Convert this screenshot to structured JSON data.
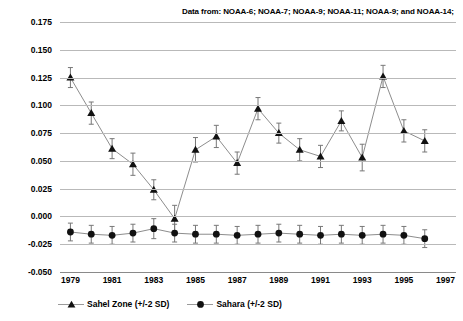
{
  "caption": {
    "data_source": "Data from: NOAA-6; NOAA-7; NOAA-9; NOAA-11; NOAA-9; and NOAA-14;"
  },
  "axes": {
    "y_title": "NDVI",
    "x_title": "",
    "y_ticks": [
      "0.175",
      "0.150",
      "0.125",
      "0.100",
      "0.075",
      "0.050",
      "0.025",
      "0.000",
      "-0.025",
      "-0.050"
    ],
    "x_ticks": [
      "1979",
      "1981",
      "1983",
      "1985",
      "1987",
      "1989",
      "1991",
      "1993",
      "1995",
      "1997"
    ]
  },
  "legend": {
    "items": [
      {
        "label": "Sahel Zone (+/-2 SD)",
        "marker": "triangle-marker-icon",
        "color": "#111111"
      },
      {
        "label": "Sahara (+/-2 SD)",
        "marker": "circle-marker-icon",
        "color": "#111111"
      }
    ]
  },
  "chart_data": {
    "type": "line",
    "title": "",
    "subtitle": "Data from: NOAA-6; NOAA-7; NOAA-9; NOAA-11; NOAA-9; and NOAA-14;",
    "xlabel": "",
    "ylabel": "NDVI",
    "xlim": [
      1978.5,
      1997.5
    ],
    "ylim": [
      -0.05,
      0.175
    ],
    "ytick_step": 0.025,
    "xtick_step": 2,
    "grid": true,
    "legend_position": "bottom-left",
    "x": [
      1979,
      1980,
      1981,
      1982,
      1983,
      1984,
      1985,
      1986,
      1987,
      1988,
      1989,
      1990,
      1991,
      1992,
      1993,
      1994,
      1995,
      1996
    ],
    "series": [
      {
        "name": "Sahel Zone (+/-2 SD)",
        "marker": "triangle",
        "color": "#111111",
        "values": [
          0.125,
          0.093,
          0.061,
          0.047,
          0.024,
          -0.002,
          0.06,
          0.072,
          0.048,
          0.097,
          0.075,
          0.06,
          0.054,
          0.086,
          0.053,
          0.126,
          0.077,
          0.068
        ],
        "error_2sd": [
          0.009,
          0.01,
          0.009,
          0.01,
          0.009,
          0.012,
          0.011,
          0.01,
          0.01,
          0.01,
          0.009,
          0.01,
          0.01,
          0.009,
          0.012,
          0.01,
          0.01,
          0.01
        ]
      },
      {
        "name": "Sahara (+/-2 SD)",
        "marker": "circle",
        "color": "#111111",
        "values": [
          -0.014,
          -0.016,
          -0.017,
          -0.015,
          -0.011,
          -0.015,
          -0.016,
          -0.016,
          -0.017,
          -0.016,
          -0.015,
          -0.016,
          -0.017,
          -0.016,
          -0.017,
          -0.016,
          -0.017,
          -0.02
        ],
        "error_2sd": [
          0.008,
          0.008,
          0.008,
          0.008,
          0.009,
          0.008,
          0.008,
          0.008,
          0.008,
          0.008,
          0.008,
          0.008,
          0.008,
          0.008,
          0.008,
          0.008,
          0.008,
          0.008
        ]
      }
    ]
  }
}
